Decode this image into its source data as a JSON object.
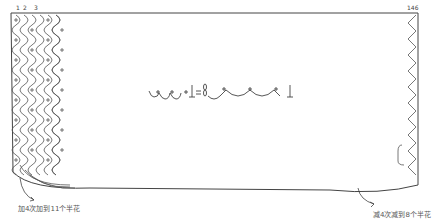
{
  "diagram": {
    "type": "crochet-chart",
    "column_numbers": {
      "first": "1",
      "second": "2",
      "third": "3",
      "last": "146"
    },
    "legend": {
      "description": "ch-sc mesh stitch symbol equivalence",
      "equals": "="
    },
    "annotations": {
      "bottom_left": "加4次加到11个半花",
      "bottom_right": "减4次减到8个半花"
    },
    "colors": {
      "line": "#444444",
      "text": "#555555",
      "background": "#ffffff"
    }
  }
}
